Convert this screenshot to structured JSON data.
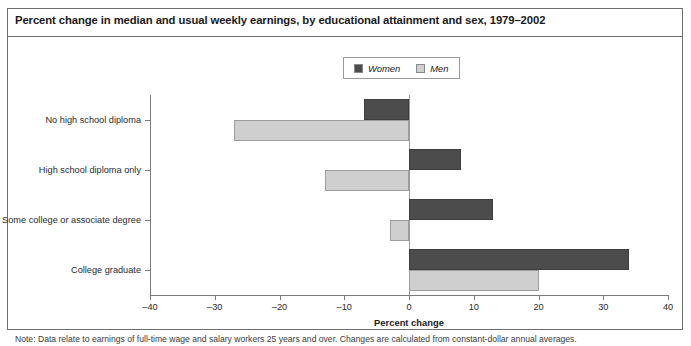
{
  "figure": {
    "title": "Percent change in median and usual weekly earnings, by educational attainment and sex, 1979–2002",
    "note": "Note: Data relate to earnings of full-time wage and salary workers 25 years and over. Changes are calculated from constant-dollar annual averages."
  },
  "colors": {
    "women": "#4c4c4c",
    "men": "#cfcfcf",
    "axis": "#7a7a7a",
    "frame": "#6e6e6e",
    "text": "#231f20"
  },
  "chart_data": {
    "type": "bar",
    "orientation": "horizontal",
    "title": "Percent change in median and usual weekly earnings, by educational attainment and sex, 1979–2002",
    "xlabel": "Percent change",
    "ylabel": "",
    "xlim": [
      -40,
      40
    ],
    "xticks": [
      -40,
      -30,
      -20,
      -10,
      0,
      10,
      20,
      30,
      40
    ],
    "xtick_labels": [
      "–40",
      "–30",
      "–20",
      "–10",
      "0",
      "10",
      "20",
      "30",
      "40"
    ],
    "grid": false,
    "legend_position": "top-center",
    "categories": [
      "No high school diploma",
      "High school diploma only",
      "Some college or associate degree",
      "College graduate"
    ],
    "series": [
      {
        "name": "Women",
        "color": "#4c4c4c",
        "values": [
          -7,
          8,
          13,
          34
        ]
      },
      {
        "name": "Men",
        "color": "#cfcfcf",
        "values": [
          -27,
          -13,
          -3,
          20
        ]
      }
    ]
  },
  "legend": {
    "entries": [
      {
        "label": "Women",
        "color": "#4c4c4c"
      },
      {
        "label": "Men",
        "color": "#cfcfcf"
      }
    ]
  }
}
